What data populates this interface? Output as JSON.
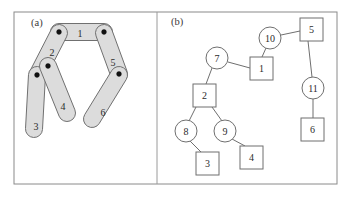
{
  "figure": {
    "caption_a": "(a)",
    "caption_b": "(b)",
    "frame": {
      "x": 14,
      "y": 12,
      "width": 323,
      "height": 172
    },
    "divider_x": 157,
    "border_color": "#8a8a8a",
    "link_fill_color": "#dcdcdc",
    "link_stroke_color": "#707070",
    "joint_color": "#111111",
    "node_stroke_color": "#6f6f6f",
    "background_color": "#ffffff"
  },
  "panel_a": {
    "label": "(a)",
    "label_pos": {
      "x": 31,
      "y": 26
    },
    "description": "linkage mechanism with six numbered bodies and pin joints",
    "links": [
      {
        "id": "link-1",
        "label": "1",
        "label_pos": {
          "x": 80,
          "y": 33
        },
        "x1": 59,
        "y1": 32,
        "x2": 104,
        "y2": 32,
        "halfwidth": 8.5
      },
      {
        "id": "link-2",
        "label": "2",
        "label_pos": {
          "x": 52,
          "y": 52
        },
        "x1": 59,
        "y1": 33,
        "x2": 38,
        "y2": 74,
        "halfwidth": 8.5
      },
      {
        "id": "link-3",
        "label": "3",
        "label_pos": {
          "x": 36,
          "y": 126
        },
        "x1": 37,
        "y1": 75,
        "x2": 34,
        "y2": 129,
        "halfwidth": 8.5
      },
      {
        "id": "link-4",
        "label": "4",
        "label_pos": {
          "x": 63,
          "y": 106
        },
        "x1": 48,
        "y1": 66,
        "x2": 67,
        "y2": 113,
        "halfwidth": 8.5
      },
      {
        "id": "link-5",
        "label": "5",
        "label_pos": {
          "x": 113,
          "y": 62
        },
        "x1": 104,
        "y1": 33,
        "x2": 119,
        "y2": 74,
        "halfwidth": 8.5
      },
      {
        "id": "link-6",
        "label": "6",
        "label_pos": {
          "x": 103,
          "y": 112
        },
        "x1": 119,
        "y1": 75,
        "x2": 92,
        "y2": 119,
        "halfwidth": 8.5
      }
    ],
    "joints": [
      {
        "id": "joint-a",
        "x": 59,
        "y": 32,
        "r": 2.4
      },
      {
        "id": "joint-b",
        "x": 104,
        "y": 32,
        "r": 2.4
      },
      {
        "id": "joint-c",
        "x": 48,
        "y": 66,
        "r": 2.4
      },
      {
        "id": "joint-d",
        "x": 37,
        "y": 75,
        "r": 2.4
      },
      {
        "id": "joint-e",
        "x": 119,
        "y": 74,
        "r": 2.4
      }
    ]
  },
  "panel_b": {
    "label": "(b)",
    "label_pos": {
      "x": 171,
      "y": 25
    },
    "description": "tree graph with circle nodes and square nodes connected by edges",
    "circle_nodes": [
      {
        "id": "circle-7",
        "label": "7",
        "cx": 217,
        "cy": 58,
        "r": 11
      },
      {
        "id": "circle-8",
        "label": "8",
        "cx": 186,
        "cy": 131,
        "r": 11
      },
      {
        "id": "circle-9",
        "label": "9",
        "cx": 225,
        "cy": 131,
        "r": 11
      },
      {
        "id": "circle-10",
        "label": "10",
        "cx": 270,
        "cy": 38,
        "r": 11
      },
      {
        "id": "circle-11",
        "label": "11",
        "cx": 313,
        "cy": 88,
        "r": 11
      }
    ],
    "square_nodes": [
      {
        "id": "square-1",
        "label": "1",
        "x": 250,
        "y": 57,
        "size": 23
      },
      {
        "id": "square-2",
        "label": "2",
        "x": 193,
        "y": 84,
        "size": 23
      },
      {
        "id": "square-3",
        "label": "3",
        "x": 196,
        "y": 152,
        "size": 23
      },
      {
        "id": "square-4",
        "label": "4",
        "x": 240,
        "y": 146,
        "size": 23
      },
      {
        "id": "square-5",
        "label": "5",
        "x": 300,
        "y": 18,
        "size": 23
      },
      {
        "id": "square-6",
        "label": "6",
        "x": 301,
        "y": 118,
        "size": 23
      }
    ],
    "edges": [
      {
        "id": "edge-7-1",
        "from": "circle-7",
        "to": "square-1",
        "x1": 228,
        "y1": 62,
        "x2": 250,
        "y2": 68
      },
      {
        "id": "edge-7-2",
        "from": "circle-7",
        "to": "square-2",
        "x1": 212,
        "y1": 68,
        "x2": 206,
        "y2": 84
      },
      {
        "id": "edge-10-1",
        "from": "circle-10",
        "to": "square-1",
        "x1": 266,
        "y1": 48,
        "x2": 262,
        "y2": 57
      },
      {
        "id": "edge-10-5",
        "from": "circle-10",
        "to": "square-5",
        "x1": 281,
        "y1": 35,
        "x2": 300,
        "y2": 31
      },
      {
        "id": "edge-5-11",
        "from": "square-5",
        "to": "circle-11",
        "x1": 308,
        "y1": 41,
        "x2": 312,
        "y2": 77
      },
      {
        "id": "edge-11-6",
        "from": "circle-11",
        "to": "square-6",
        "x1": 313,
        "y1": 99,
        "x2": 313,
        "y2": 118
      },
      {
        "id": "edge-2-8",
        "from": "square-2",
        "to": "circle-8",
        "x1": 196,
        "y1": 107,
        "x2": 189,
        "y2": 121
      },
      {
        "id": "edge-2-9",
        "from": "square-2",
        "to": "circle-9",
        "x1": 212,
        "y1": 107,
        "x2": 222,
        "y2": 121
      },
      {
        "id": "edge-8-3",
        "from": "circle-8",
        "to": "square-3",
        "x1": 190,
        "y1": 141,
        "x2": 201,
        "y2": 152
      },
      {
        "id": "edge-9-4",
        "from": "circle-9",
        "to": "square-4",
        "x1": 232,
        "y1": 139,
        "x2": 245,
        "y2": 146
      }
    ]
  }
}
